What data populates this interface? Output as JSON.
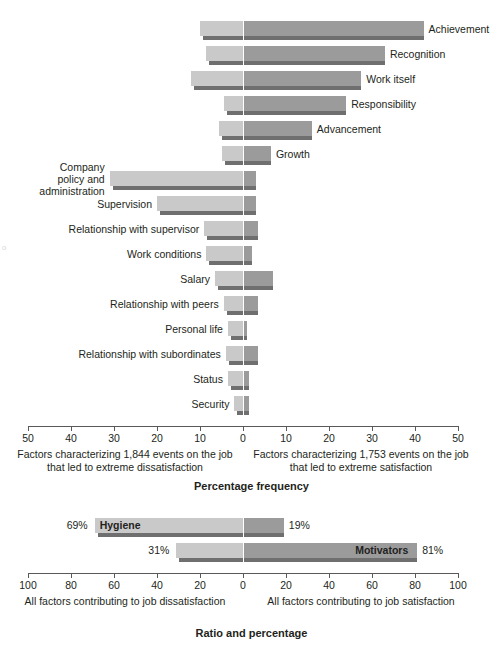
{
  "chart_data": [
    {
      "type": "bar",
      "orientation": "horizontal-diverging",
      "title": "Percentage frequency",
      "xlabel": "Percentage frequency",
      "ylabel": "",
      "xlim": [
        -50,
        50
      ],
      "xticks": [
        50,
        40,
        30,
        20,
        10,
        0,
        10,
        20,
        30,
        40,
        50
      ],
      "grid": false,
      "legend": "none",
      "left_caption": "Factors characterizing 1,844 events on the\njob that led to extreme dissatisfaction",
      "right_caption": "Factors characterizing 1,753 events on the\njob that led to extreme satisfaction",
      "categories": [
        "Achievement",
        "Recognition",
        "Work itself",
        "Responsibility",
        "Advancement",
        "Growth",
        "Company policy and administration",
        "Supervision",
        "Relationship with supervisor",
        "Work conditions",
        "Salary",
        "Relationship with peers",
        "Personal life",
        "Relationship with subordinates",
        "Status",
        "Security"
      ],
      "series": [
        {
          "name": "Dissatisfaction",
          "values": [
            10.0,
            8.5,
            12.0,
            4.5,
            5.5,
            5.0,
            31.0,
            20.0,
            9.0,
            8.5,
            6.5,
            4.5,
            3.5,
            4.0,
            3.5,
            2.0
          ]
        },
        {
          "name": "Satisfaction",
          "values": [
            42.0,
            33.0,
            27.5,
            24.0,
            16.0,
            6.5,
            3.0,
            3.0,
            3.5,
            2.0,
            7.0,
            3.5,
            1.0,
            3.5,
            1.5,
            1.5
          ]
        }
      ]
    },
    {
      "type": "bar",
      "orientation": "horizontal-diverging",
      "title": "Ratio and percentage",
      "xlabel": "Ratio and percentage",
      "xlim": [
        -100,
        100
      ],
      "xticks": [
        100,
        80,
        60,
        40,
        20,
        0,
        20,
        40,
        60,
        80,
        100
      ],
      "grid": false,
      "left_caption": "All factors contributing\nto job dissatisfaction",
      "right_caption": "All factors contributing\nto job satisfaction",
      "categories": [
        "Hygiene",
        "Motivators"
      ],
      "series": [
        {
          "name": "Dissatisfaction",
          "values": [
            69,
            31
          ]
        },
        {
          "name": "Satisfaction",
          "values": [
            19,
            81
          ]
        }
      ],
      "data_labels": {
        "Hygiene": {
          "left": "69%",
          "right": "19%"
        },
        "Motivators": {
          "left": "31%",
          "right": "81%"
        }
      }
    }
  ],
  "top_chart": {
    "rows": [
      {
        "label": "Achievement",
        "label_side": "right",
        "left": 10.0,
        "right": 42.0
      },
      {
        "label": "Recognition",
        "label_side": "right",
        "left": 8.5,
        "right": 33.0
      },
      {
        "label": "Work itself",
        "label_side": "right",
        "left": 12.0,
        "right": 27.5
      },
      {
        "label": "Responsibility",
        "label_side": "right",
        "left": 4.5,
        "right": 24.0
      },
      {
        "label": "Advancement",
        "label_side": "right",
        "left": 5.5,
        "right": 16.0
      },
      {
        "label": "Growth",
        "label_side": "right",
        "left": 5.0,
        "right": 6.5
      },
      {
        "label": "Company\npolicy and\nadministration",
        "label_side": "left",
        "left": 31.0,
        "right": 3.0
      },
      {
        "label": "Supervision",
        "label_side": "left",
        "left": 20.0,
        "right": 3.0
      },
      {
        "label": "Relationship with supervisor",
        "label_side": "left",
        "left": 9.0,
        "right": 3.5
      },
      {
        "label": "Work conditions",
        "label_side": "left",
        "left": 8.5,
        "right": 2.0
      },
      {
        "label": "Salary",
        "label_side": "left",
        "left": 6.5,
        "right": 7.0
      },
      {
        "label": "Relationship with peers",
        "label_side": "left",
        "left": 4.5,
        "right": 3.5
      },
      {
        "label": "Personal life",
        "label_side": "left",
        "left": 3.5,
        "right": 1.0
      },
      {
        "label": "Relationship with subordinates",
        "label_side": "left",
        "left": 4.0,
        "right": 3.5
      },
      {
        "label": "Status",
        "label_side": "left",
        "left": 3.5,
        "right": 1.5
      },
      {
        "label": "Security",
        "label_side": "left",
        "left": 2.0,
        "right": 1.5
      }
    ],
    "ticks": [
      "50",
      "40",
      "30",
      "20",
      "10",
      "0",
      "10",
      "20",
      "30",
      "40",
      "50"
    ],
    "left_caption": "Factors characterizing 1,844 events on the\njob that led to extreme dissatisfaction",
    "right_caption": "Factors characterizing 1,753 events on the\njob that led to extreme satisfaction",
    "axis_title": "Percentage frequency"
  },
  "bottom_chart": {
    "rows": [
      {
        "label": "Hygiene",
        "label_side": "inbar-left",
        "left": 69,
        "right": 19,
        "left_pct": "69%",
        "right_pct": "19%"
      },
      {
        "label": "Motivators",
        "label_side": "inbar-right",
        "left": 31,
        "right": 81,
        "left_pct": "31%",
        "right_pct": "81%"
      }
    ],
    "ticks": [
      "100",
      "80",
      "60",
      "40",
      "20",
      "0",
      "20",
      "40",
      "60",
      "80",
      "100"
    ],
    "left_caption": "All factors contributing\nto job dissatisfaction",
    "right_caption": "All factors contributing\nto job satisfaction",
    "axis_title": "Ratio and percentage"
  },
  "colors": {
    "bar_left": "#c9c9c9",
    "bar_right": "#9b9b9b",
    "shadow": "#6f6f6f",
    "axis": "#58595b",
    "text": "#231f20"
  }
}
